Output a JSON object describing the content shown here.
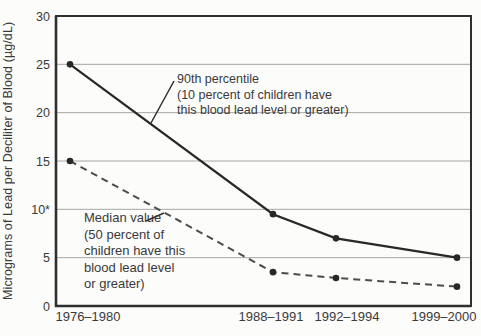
{
  "figure": {
    "background": "#fcfcfa"
  },
  "chart_data": {
    "type": "line",
    "title": "",
    "xlabel": "",
    "ylabel": "Micrograms of Lead per Deciliter of Blood (µg/dL)",
    "categories": [
      "1976–1980",
      "1988–1991",
      "1992–1994",
      "1999–2000"
    ],
    "ylim": [
      0,
      30
    ],
    "yticks": [
      {
        "value": 30,
        "label": "30"
      },
      {
        "value": 25,
        "label": "25"
      },
      {
        "value": 20,
        "label": "20"
      },
      {
        "value": 15,
        "label": "15"
      },
      {
        "value": 10,
        "label": "10*"
      },
      {
        "value": 5,
        "label": "5"
      },
      {
        "value": 0,
        "label": "0"
      }
    ],
    "grid": "horizontal-light",
    "legend": "in-plot annotations with leader lines",
    "series": [
      {
        "name": "90th percentile",
        "line_style": "solid",
        "marker": "dot",
        "values": [
          25,
          9.5,
          7,
          5
        ]
      },
      {
        "name": "Median value",
        "line_style": "dashed",
        "marker": "dot",
        "values": [
          15,
          3.5,
          2.9,
          2
        ]
      }
    ],
    "annotations": [
      {
        "series": "90th percentile",
        "text": "90th percentile\n(10 percent of children have\nthis blood lead level or greater)",
        "x": 177,
        "y": 72,
        "leader": [
          [
            174,
            81
          ],
          [
            151,
            123
          ]
        ]
      },
      {
        "series": "Median value",
        "text": "Median value\n(50 percent of\nchildren have this\nblood lead level\nor greater)",
        "x": 84,
        "y": 210,
        "leader": [
          [
            146,
            221
          ],
          [
            164,
            213
          ]
        ]
      }
    ],
    "colors": {
      "line": "#282828",
      "dashed_line": "#4c4c4c",
      "grid": "#a6a6a6",
      "axis": "#2f2f2f",
      "text": "#3a3a3a"
    },
    "layout": {
      "plot": {
        "left": 56,
        "top": 16,
        "right": 471,
        "bottom": 306
      },
      "x_px": [
        70,
        273,
        336,
        457
      ],
      "xlabel_centers_px": [
        88,
        271,
        347,
        444
      ],
      "xlabel_y_px": 321,
      "ytick_right_px": 50
    }
  }
}
